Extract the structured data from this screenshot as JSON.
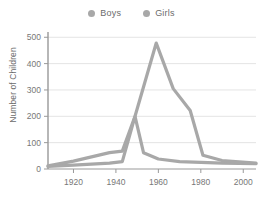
{
  "legend": {
    "position": "top-center",
    "entries": [
      {
        "label": "Boys",
        "color": "#a8a8a8",
        "marker": "circle"
      },
      {
        "label": "Girls",
        "color": "#a8a8a8",
        "marker": "circle"
      }
    ]
  },
  "axes": {
    "ylabel": "Number of Children",
    "xlabel": "",
    "yticks": [
      "0",
      "100",
      "200",
      "300",
      "400",
      "500"
    ],
    "xticks": [
      "1920",
      "1940",
      "1960",
      "1980",
      "2000"
    ]
  },
  "chart_data": {
    "type": "line",
    "title": "",
    "xlabel": "",
    "ylabel": "Number of Children",
    "xlim": [
      1908,
      2006
    ],
    "ylim": [
      0,
      520
    ],
    "yticks": [
      0,
      100,
      200,
      300,
      400,
      500
    ],
    "xticks": [
      1920,
      1940,
      1960,
      1980,
      2000
    ],
    "grid": "horizontal",
    "legend_position": "top-center",
    "series": [
      {
        "name": "Boys",
        "color": "#a8a8a8",
        "x": [
          1908,
          1920,
          1937,
          1943,
          1949,
          1953,
          1960,
          1970,
          1980,
          1990,
          2006
        ],
        "values": [
          10,
          15,
          22,
          28,
          200,
          62,
          38,
          28,
          25,
          22,
          20
        ]
      },
      {
        "name": "Girls",
        "color": "#a8a8a8",
        "x": [
          1908,
          1920,
          1937,
          1943,
          1949,
          1959,
          1967,
          1975,
          1981,
          1990,
          2006
        ],
        "values": [
          12,
          30,
          62,
          68,
          200,
          478,
          305,
          222,
          52,
          32,
          22
        ]
      }
    ]
  }
}
